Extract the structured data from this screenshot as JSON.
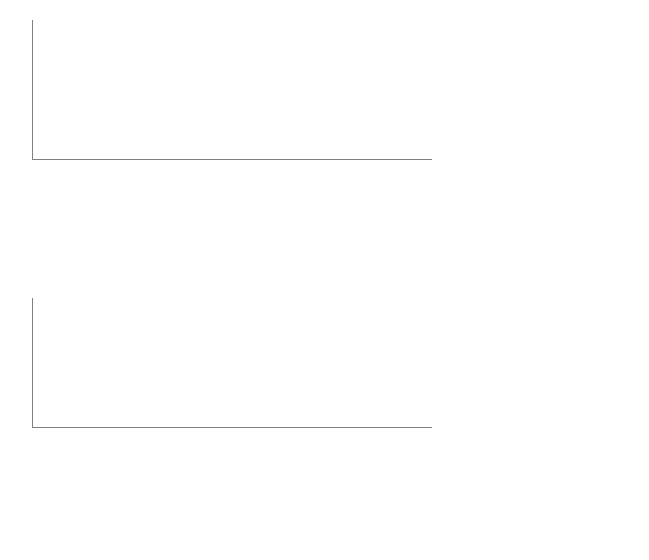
{
  "figure": {
    "caption": "Fig. 8.6. Asia Minor. Columns, bases, and altars with inscriptions compared to other monuments with inscriptions, from IK mentioni"
  },
  "colors": {
    "dark": "#595959",
    "medium": "#808080",
    "light": "#a6a6a6",
    "grid": "#a9a9a9",
    "axis": "#808080",
    "text": "#111111"
  },
  "chart_data": [
    {
      "type": "bar",
      "id": "chart-top",
      "stacked": true,
      "title": "",
      "xlabel": "",
      "ylabel": "",
      "ylim": [
        0,
        25
      ],
      "yticks": [
        0,
        5,
        10,
        15,
        20,
        25
      ],
      "grid": true,
      "legend_position": "right",
      "categories": [
        "military",
        "elite",
        "gladiator",
        "oikonomos/pragmanteutes",
        "administration",
        "physician",
        "entertainment",
        "freedman",
        "slave",
        "jurisdiction",
        "intelligentsia",
        "slave, administrative",
        "trade",
        "architect",
        "freedman, imperial",
        "slave, imperial",
        "sports"
      ],
      "series": [
        {
          "name": "Altar",
          "color": "#595959",
          "values": [
            13,
            4,
            4,
            2,
            1,
            1,
            2,
            2,
            4,
            3,
            1,
            1,
            2,
            1,
            1,
            1,
            1
          ]
        },
        {
          "name": "Base",
          "color": "#808080",
          "values": [
            6,
            6,
            6,
            4,
            4,
            1,
            2,
            2,
            0,
            0,
            1,
            1,
            0,
            0,
            0,
            0,
            0
          ]
        },
        {
          "name": "Column",
          "color": "#a6a6a6",
          "values": [
            4,
            8,
            1,
            1,
            0,
            3,
            0,
            0,
            0,
            0,
            0,
            0,
            0,
            0,
            0,
            0,
            0
          ]
        }
      ],
      "totals": [
        23,
        18,
        11,
        7,
        5,
        5,
        4,
        4,
        4,
        3,
        2,
        2,
        2,
        1,
        1,
        1,
        1
      ]
    },
    {
      "type": "bar",
      "id": "chart-bottom",
      "stacked": false,
      "title": "",
      "xlabel": "",
      "ylabel": "",
      "ylim": [
        0,
        50
      ],
      "yticks": [
        0,
        5,
        10,
        15,
        20,
        25,
        30,
        35,
        40,
        45,
        50
      ],
      "grid": true,
      "legend_position": "right",
      "categories": [
        "military",
        "elite",
        "gladiator",
        "oikonomos/pragmanteutes",
        "administration",
        "physician",
        "entertainment",
        "freedman",
        "slave",
        "jurisdiction",
        "intelligentsia",
        "slave, administrative",
        "trade",
        "architect",
        "freedman, imperial",
        "slave, imperial",
        "sports"
      ],
      "series": [
        {
          "name": "total (column, base, altar)",
          "color": "#595959",
          "values": [
            23,
            18,
            11,
            7,
            5,
            5,
            4,
            4,
            4,
            3,
            2,
            2,
            2,
            1,
            1,
            1,
            1
          ]
        },
        {
          "name": "other (known types)",
          "color": "#808080",
          "values": [
            43,
            33,
            35,
            10,
            11,
            8,
            8,
            17,
            8,
            4,
            1,
            10,
            1,
            1,
            1,
            10,
            1
          ]
        }
      ]
    }
  ]
}
